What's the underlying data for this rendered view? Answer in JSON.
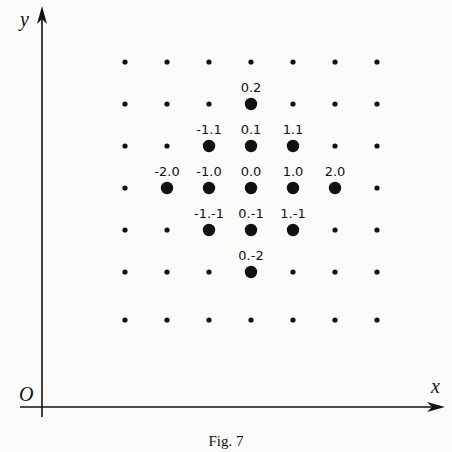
{
  "figure": {
    "caption": "Fig. 7",
    "axes": {
      "x_label": "x",
      "y_label": "y",
      "origin_label": "O"
    },
    "colors": {
      "ink": "#111111",
      "background": "#fbfbf9"
    }
  },
  "chart_data": {
    "type": "scatter",
    "title": "Fig. 7",
    "xlabel": "x",
    "ylabel": "y",
    "grid_columns": 7,
    "grid_rows": 7,
    "highlighted_points": [
      {
        "label": "0.2",
        "i": 0,
        "j": 2
      },
      {
        "label": "-1.1",
        "i": -1,
        "j": 1
      },
      {
        "label": "0.1",
        "i": 0,
        "j": 1
      },
      {
        "label": "1.1",
        "i": 1,
        "j": 1
      },
      {
        "label": "-2.0",
        "i": -2,
        "j": 0
      },
      {
        "label": "-1.0",
        "i": -1,
        "j": 0
      },
      {
        "label": "0.0",
        "i": 0,
        "j": 0
      },
      {
        "label": "1.0",
        "i": 1,
        "j": 0
      },
      {
        "label": "2.0",
        "i": 2,
        "j": 0
      },
      {
        "label": "-1.-1",
        "i": -1,
        "j": -1
      },
      {
        "label": "0.-1",
        "i": 0,
        "j": -1
      },
      {
        "label": "1.-1",
        "i": 1,
        "j": -1
      },
      {
        "label": "0.-2",
        "i": 0,
        "j": -2
      }
    ]
  }
}
